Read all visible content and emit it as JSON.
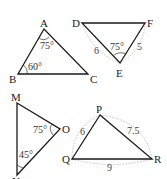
{
  "triangles": [
    {
      "name": "ABC",
      "vertices": [
        "A",
        "B",
        "C"
      ],
      "angles": [
        {
          "vertex": "A",
          "label": "75°"
        },
        {
          "vertex": "B",
          "label": "60°"
        }
      ],
      "sides": []
    },
    {
      "name": "DEF",
      "vertices": [
        "D",
        "E",
        "F"
      ],
      "angles": [
        {
          "vertex": "E",
          "label": "75°"
        }
      ],
      "sides": [
        {
          "between": "DE",
          "label": "6"
        },
        {
          "between": "EF",
          "label": "5"
        }
      ]
    },
    {
      "name": "MNO",
      "vertices": [
        "M",
        "N",
        "O"
      ],
      "angles": [
        {
          "vertex": "O",
          "label": "75°"
        },
        {
          "vertex": "N",
          "label": "45°"
        }
      ],
      "sides": []
    },
    {
      "name": "PQR",
      "vertices": [
        "P",
        "Q",
        "R"
      ],
      "angles": [],
      "sides": [
        {
          "between": "PQ",
          "label": "6"
        },
        {
          "between": "PR",
          "label": "7.5"
        },
        {
          "between": "QR",
          "label": "9"
        }
      ]
    }
  ]
}
